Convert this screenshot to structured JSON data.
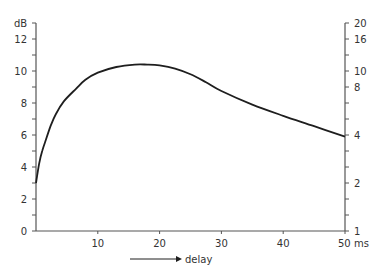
{
  "chart_data": {
    "type": "line",
    "title": "",
    "xlabel": "delay",
    "xunit": "ms",
    "ylabel": "dB",
    "y2label": "",
    "xlim": [
      0,
      50
    ],
    "ylim": [
      0,
      13
    ],
    "grid": false,
    "legend": null,
    "x_ticks": [
      10,
      20,
      30,
      40,
      50
    ],
    "x_tick_labels": [
      "10",
      "20",
      "30",
      "40",
      "50 ms"
    ],
    "y_ticks": [
      0,
      2,
      4,
      6,
      8,
      10,
      12
    ],
    "y_tick_labels": [
      "0",
      "2",
      "4",
      "6",
      "8",
      "10",
      "12"
    ],
    "y_minor_ticks": [
      1,
      3,
      5,
      7,
      9,
      11,
      13
    ],
    "y2_ticks_db": [
      0,
      3,
      6,
      9,
      10,
      12,
      13
    ],
    "y2_tick_labels": [
      "1",
      "2",
      "4",
      "8",
      "10",
      "16",
      "20"
    ],
    "y2_minor_ticks_db": [
      1,
      2,
      4,
      5,
      7,
      8,
      11
    ],
    "series": [
      {
        "name": "gain",
        "x": [
          0,
          0.5,
          1,
          1.6,
          2.4,
          3.2,
          4.5,
          6.5,
          8,
          10,
          13,
          16,
          18,
          20,
          22.5,
          25,
          27.5,
          30,
          35,
          40,
          45,
          50
        ],
        "values": [
          3.0,
          4.2,
          5.0,
          5.7,
          6.6,
          7.3,
          8.1,
          8.9,
          9.45,
          9.9,
          10.25,
          10.4,
          10.4,
          10.35,
          10.15,
          9.8,
          9.3,
          8.75,
          7.9,
          7.2,
          6.55,
          5.9
        ]
      }
    ],
    "annotations": [
      {
        "type": "arrow",
        "text": "delay",
        "direction": "right"
      }
    ]
  },
  "axes": {
    "left_unit": "dB",
    "bottom_unit": "ms",
    "arrow_label": "delay"
  },
  "colors": {
    "curve": "#1e1e1e",
    "axis": "#555555",
    "text": "#333333"
  }
}
